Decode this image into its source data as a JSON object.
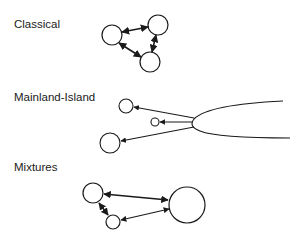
{
  "panels": [
    {
      "id": "classical",
      "label": "Classical"
    },
    {
      "id": "mainland-island",
      "label": "Mainland-Island"
    },
    {
      "id": "mixtures",
      "label": "Mixtures"
    }
  ],
  "colors": {
    "stroke": "#1a1a1a",
    "background": "#ffffff"
  }
}
